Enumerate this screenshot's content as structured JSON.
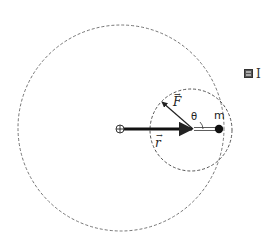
{
  "figure": {
    "labels": {
      "force_vector": "F",
      "position_vector": "r",
      "angle": "θ",
      "mass": "m",
      "vector_arrow": "→",
      "side_text": "I"
    },
    "icons": {
      "origin": "circled-plus-icon",
      "side": "image-thumbnail-icon"
    },
    "geometry": {
      "large_circle": {
        "cx": 121,
        "cy": 128,
        "r": 103,
        "style": "dashed"
      },
      "small_circle": {
        "cx": 191,
        "cy": 130,
        "r": 41,
        "style": "dashed"
      },
      "origin": {
        "x": 120,
        "y": 129
      },
      "r_vector": {
        "from": [
          124,
          129
        ],
        "to": [
          193,
          129
        ]
      },
      "rod": {
        "from": [
          193,
          129
        ],
        "to": [
          219,
          129
        ]
      },
      "f_vector": {
        "from": [
          193,
          129
        ],
        "to": [
          161,
          101
        ]
      },
      "mass": {
        "x": 219,
        "y": 129,
        "r": 4
      }
    },
    "colors": {
      "stroke": "#222222",
      "dashed": "#555555",
      "background": "#ffffff"
    }
  }
}
